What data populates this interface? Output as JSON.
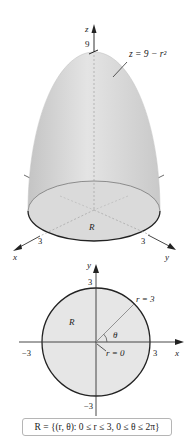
{
  "surface_figure": {
    "z_axis_label": "z",
    "z_tick": "9",
    "equation": "z = 9 − r²",
    "region_label": "R",
    "x_axis_label": "x",
    "y_axis_label": "y",
    "x_tick": "3",
    "y_tick": "3"
  },
  "polar_figure": {
    "x_axis_label": "x",
    "y_axis_label": "y",
    "y_tick_top": "3",
    "y_tick_bottom": "−3",
    "x_tick_left": "−3",
    "x_tick_right": "3",
    "region_label": "R",
    "radius_label": "r = 3",
    "origin_label": "r = 0",
    "angle_label": "θ"
  },
  "caption": "R = {(r, θ): 0 ≤ r ≤ 3, 0 ≤ θ ≤ 2π}",
  "colors": {
    "surface_fill": "#d9d9d9",
    "disk_fill": "#e6e6e6",
    "outline": "#222222",
    "guide": "#9a9a9a"
  }
}
